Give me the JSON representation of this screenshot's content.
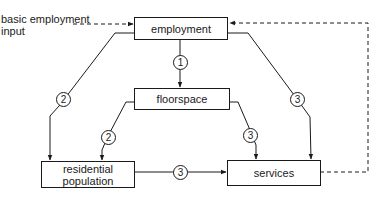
{
  "diagram": {
    "input_label": "basic employment input",
    "input_label_lines": [
      "basic employment",
      "input"
    ],
    "nodes": {
      "employment": "employment",
      "floorspace": "floorspace",
      "residential_population": "residential population",
      "residential_population_lines": [
        "residential",
        "population"
      ],
      "services": "services"
    },
    "edges": [
      {
        "from": "employment",
        "to": "floorspace",
        "label": "1"
      },
      {
        "from": "employment",
        "to": "residential_population",
        "label": "2"
      },
      {
        "from": "floorspace",
        "to": "residential_population",
        "label": "2"
      },
      {
        "from": "employment",
        "to": "services",
        "label": "3"
      },
      {
        "from": "floorspace",
        "to": "services",
        "label": "3"
      },
      {
        "from": "residential_population",
        "to": "services",
        "label": "3"
      },
      {
        "from": "services",
        "to": "employment",
        "label": "",
        "style": "dashed"
      },
      {
        "from": "input",
        "to": "employment",
        "label": "",
        "style": "dashed"
      }
    ],
    "line_color": "#1a1a1a"
  }
}
